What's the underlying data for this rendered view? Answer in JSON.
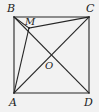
{
  "figure": {
    "kind": "geometry-diagram",
    "background_color": "#f2f2f2",
    "stroke_color": "#262626",
    "stroke_width": 1.1,
    "labels": {
      "a": "A",
      "b": "B",
      "c": "C",
      "d": "D",
      "m": "M",
      "o": "O"
    },
    "points": {
      "A": {
        "x": 14,
        "y": 93
      },
      "B": {
        "x": 14,
        "y": 17
      },
      "C": {
        "x": 89,
        "y": 17
      },
      "D": {
        "x": 89,
        "y": 93
      },
      "M": {
        "x": 29,
        "y": 28
      },
      "O": {
        "x": 51,
        "y": 55
      }
    },
    "segments": [
      {
        "name": "side-AB",
        "from": "A",
        "to": "B"
      },
      {
        "name": "side-BC",
        "from": "B",
        "to": "C"
      },
      {
        "name": "side-CD",
        "from": "C",
        "to": "D"
      },
      {
        "name": "side-DA",
        "from": "D",
        "to": "A"
      },
      {
        "name": "diagonal-AC",
        "from": "A",
        "to": "C"
      },
      {
        "name": "diagonal-BD",
        "from": "B",
        "to": "D"
      },
      {
        "name": "segment-BM",
        "from": "B",
        "to": "M"
      },
      {
        "name": "segment-MA",
        "from": "M",
        "to": "A"
      },
      {
        "name": "segment-MC",
        "from": "M",
        "to": "C"
      }
    ]
  }
}
